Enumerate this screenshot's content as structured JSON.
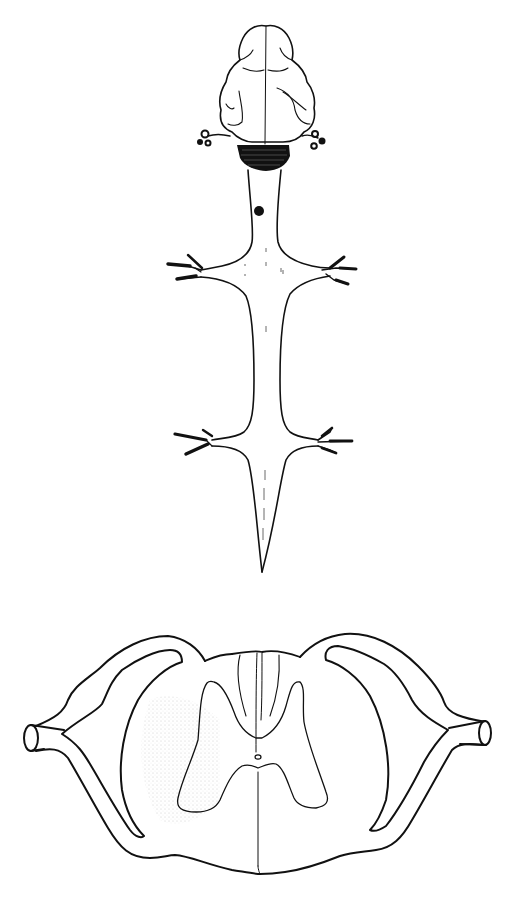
{
  "figure": {
    "title": "",
    "panels": [
      {
        "id": "dorsal-view",
        "parts": [
          "brain",
          "cerebral-hemispheres",
          "cerebellum",
          "brainstem-nerves",
          "spinal-cord",
          "cervical-enlargement",
          "brachial-nerve-roots",
          "lumbar-enlargement",
          "lumbosacral-nerve-roots",
          "conus-medullaris",
          "lesion-marker"
        ]
      },
      {
        "id": "cross-section",
        "parts": [
          "white-matter",
          "gray-matter",
          "dorsal-horn",
          "ventral-horn",
          "central-canal",
          "dorsal-median-septum",
          "ventral-median-fissure",
          "dorsal-root",
          "ventral-root",
          "spinal-nerve"
        ]
      }
    ],
    "colors": {
      "line": "#111111",
      "background": "#ffffff",
      "stipple": "#c8c8c8"
    }
  }
}
